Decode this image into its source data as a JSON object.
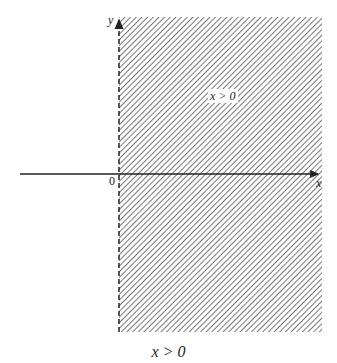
{
  "figure": {
    "region_label": "x > 0",
    "caption": "x > 0",
    "axes": {
      "x_label": "x",
      "y_label": "y",
      "origin_label": "0"
    },
    "boundary": "x = 0 (dashed, not included)",
    "shading": "hatched half-plane to the right of the y-axis",
    "colors": {
      "ink": "#222222",
      "hatch": "#555555",
      "background": "#ffffff"
    }
  }
}
